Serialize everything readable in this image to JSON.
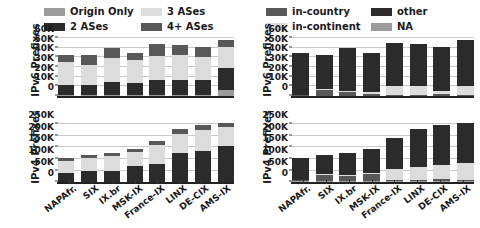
{
  "chart_data": [
    {
      "id": "ipv6-as-hops",
      "type": "bar",
      "subtype": "stacked-vertical",
      "panel": "top-left",
      "title": "",
      "xlabel": "",
      "ylabel": "IPv6 Prefixes",
      "ylim": [
        0,
        60000
      ],
      "yticks": [
        0,
        10000,
        20000,
        30000,
        40000,
        50000,
        60000
      ],
      "ytick_labels": [
        "0",
        "10K",
        "20K",
        "30K",
        "40K",
        "50K",
        "60K"
      ],
      "grid": true,
      "legend_position": "above",
      "categories": [
        "NAPAfr.",
        "SIX",
        "IX.br",
        "MSK-IX",
        "France-IX",
        "LINX",
        "DE-CIX",
        "AMS-IX"
      ],
      "series": [
        {
          "name": "Origin Only",
          "color": "#9b9b9b",
          "values": [
            1000,
            1000,
            1000,
            1000,
            1000,
            1000,
            1000,
            6500
          ]
        },
        {
          "name": "2 ASes",
          "color": "#2b2b2b",
          "values": [
            10000,
            10500,
            14000,
            12000,
            15500,
            16000,
            16000,
            23000
          ]
        },
        {
          "name": "3 ASes",
          "color": "#dcdcdc",
          "values": [
            24000,
            20500,
            24500,
            24000,
            24500,
            25000,
            23500,
            21500
          ]
        },
        {
          "name": "4+ ASes",
          "color": "#585858",
          "values": [
            7000,
            10000,
            10500,
            8000,
            13000,
            11000,
            10500,
            7000
          ]
        }
      ],
      "totals": [
        42000,
        42000,
        50000,
        45000,
        54000,
        53000,
        51000,
        58000
      ]
    },
    {
      "id": "ipv4-as-hops",
      "type": "bar",
      "subtype": "stacked-vertical",
      "panel": "bottom-left",
      "title": "",
      "xlabel": "",
      "ylabel": "IPv4 Prefixes",
      "ylim": [
        0,
        265000
      ],
      "yticks": [
        0,
        50000,
        100000,
        150000,
        200000,
        250000
      ],
      "ytick_labels": [
        "0",
        "50K",
        "100K",
        "150K",
        "200K",
        "250K"
      ],
      "grid": true,
      "legend_position": "shared-above",
      "categories": [
        "NAPAfr.",
        "SIX",
        "IX.br",
        "MSK-IX",
        "France-IX",
        "LINX",
        "DE-CIX",
        "AMS-IX"
      ],
      "series": [
        {
          "name": "Origin Only",
          "color": "#9b9b9b",
          "values": [
            2000,
            2000,
            2000,
            2000,
            2000,
            2000,
            2000,
            2000
          ]
        },
        {
          "name": "2 ASes",
          "color": "#2b2b2b",
          "values": [
            38000,
            47000,
            48000,
            68000,
            75000,
            123000,
            131000,
            155000
          ]
        },
        {
          "name": "3 ASes",
          "color": "#dcdcdc",
          "values": [
            53000,
            57000,
            62000,
            60000,
            83000,
            83000,
            92000,
            80000
          ]
        },
        {
          "name": "4+ ASes",
          "color": "#585858",
          "values": [
            12000,
            12000,
            14000,
            15000,
            17000,
            21000,
            21000,
            20000
          ]
        }
      ],
      "totals": [
        105000,
        118000,
        126000,
        145000,
        177000,
        229000,
        246000,
        257000
      ]
    },
    {
      "id": "ipv6-geo",
      "type": "bar",
      "subtype": "stacked-vertical",
      "panel": "top-right",
      "title": "",
      "xlabel": "",
      "ylabel": "IPv6 Prefixes",
      "ylim": [
        0,
        60000
      ],
      "yticks": [
        0,
        10000,
        20000,
        30000,
        40000,
        50000,
        60000
      ],
      "ytick_labels": [
        "0",
        "10K",
        "20K",
        "30K",
        "40K",
        "50K",
        "60K"
      ],
      "grid": true,
      "legend_position": "above",
      "categories": [
        "NAPAfr.",
        "SIX",
        "IX.br",
        "MSK-IX",
        "France-IX",
        "LINX",
        "DE-CIX",
        "AMS-IX"
      ],
      "series": [
        {
          "name": "NA",
          "color": "#9b9b9b",
          "values": [
            500,
            500,
            500,
            500,
            500,
            500,
            500,
            500
          ]
        },
        {
          "name": "in-country",
          "color": "#585858",
          "values": [
            500,
            6000,
            4000,
            1500,
            500,
            500,
            1500,
            500
          ]
        },
        {
          "name": "in-continent",
          "color": "#dcdcdc",
          "values": [
            500,
            500,
            500,
            2000,
            9500,
            9500,
            3500,
            9500
          ]
        },
        {
          "name": "other",
          "color": "#2b2b2b",
          "values": [
            43500,
            35000,
            45000,
            41000,
            44000,
            43000,
            45000,
            47500
          ]
        }
      ],
      "totals": [
        45000,
        42000,
        50000,
        45000,
        54500,
        53500,
        50500,
        58000
      ]
    },
    {
      "id": "ipv4-geo",
      "type": "bar",
      "subtype": "stacked-vertical",
      "panel": "bottom-right",
      "title": "",
      "xlabel": "",
      "ylabel": "IPv4 Prefixes",
      "ylim": [
        0,
        265000
      ],
      "yticks": [
        0,
        50000,
        100000,
        150000,
        200000,
        250000
      ],
      "ytick_labels": [
        "0",
        "50K",
        "100K",
        "150K",
        "200K",
        "250K"
      ],
      "grid": true,
      "legend_position": "shared-above",
      "categories": [
        "NAPAfr.",
        "SIX",
        "IX.br",
        "MSK-IX",
        "France-IX",
        "LINX",
        "DE-CIX",
        "AMS-IX"
      ],
      "series": [
        {
          "name": "NA",
          "color": "#9b9b9b",
          "values": [
            4000,
            4000,
            4000,
            4000,
            4000,
            4000,
            4000,
            4000
          ]
        },
        {
          "name": "in-country",
          "color": "#585858",
          "values": [
            3000,
            26000,
            23000,
            32000,
            4000,
            4000,
            9000,
            4000
          ]
        },
        {
          "name": "in-continent",
          "color": "#dcdcdc",
          "values": [
            3000,
            3000,
            3000,
            3000,
            50000,
            56000,
            63000,
            76000
          ]
        },
        {
          "name": "other",
          "color": "#2b2b2b",
          "values": [
            95000,
            85000,
            98000,
            106000,
            135000,
            165000,
            170000,
            173000
          ]
        }
      ],
      "totals": [
        105000,
        118000,
        128000,
        145000,
        193000,
        229000,
        246000,
        257000
      ]
    }
  ],
  "left_panel": {
    "legend": {
      "items": [
        {
          "label": "Origin Only",
          "color": "#9b9b9b"
        },
        {
          "label": "3 ASes",
          "color": "#dcdcdc"
        },
        {
          "label": "2 ASes",
          "color": "#2b2b2b"
        },
        {
          "label": "4+ ASes",
          "color": "#585858"
        }
      ]
    },
    "ipv6": {
      "ylabel": "IPv6 Prefixes",
      "ytick_labels": [
        "60K",
        "50K",
        "40K",
        "30K",
        "20K",
        "10K",
        "0"
      ]
    },
    "ipv4": {
      "ylabel": "IPv4 Prefixes",
      "ytick_labels": [
        "250K",
        "200K",
        "150K",
        "100K",
        "50K",
        "0"
      ]
    },
    "xtick_labels": [
      "NAPAfr.",
      "SIX",
      "IX.br",
      "MSK-IX",
      "France-IX",
      "LINX",
      "DE-CIX",
      "AMS-IX"
    ]
  },
  "right_panel": {
    "legend": {
      "items": [
        {
          "label": "in-country",
          "color": "#585858"
        },
        {
          "label": "other",
          "color": "#2b2b2b"
        },
        {
          "label": "in-continent",
          "color": "#dcdcdc"
        },
        {
          "label": "NA",
          "color": "#9b9b9b"
        }
      ]
    },
    "ipv6": {
      "ylabel": "IPv6 Prefixes",
      "ytick_labels": [
        "60K",
        "50K",
        "40K",
        "30K",
        "20K",
        "10K",
        "0"
      ]
    },
    "ipv4": {
      "ylabel": "IPv4 Prefixes",
      "ytick_labels": [
        "250K",
        "200K",
        "150K",
        "100K",
        "50K",
        "0"
      ]
    },
    "xtick_labels": [
      "NAPAfr.",
      "SIX",
      "IX.br",
      "MSK-IX",
      "France-IX",
      "LINX",
      "DE-CIX",
      "AMS-IX"
    ]
  }
}
